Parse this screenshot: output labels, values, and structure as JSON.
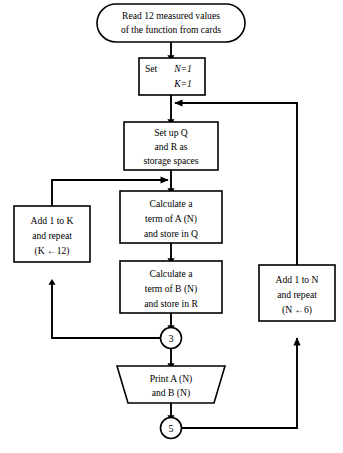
{
  "diagram": {
    "line_color": "#000000",
    "fill_color": "#ffffff"
  },
  "nodes": {
    "read_terminal": {
      "shape": "stadium",
      "lines": [
        "Read 12 measured values",
        "of the function from cards"
      ]
    },
    "set_init": {
      "shape": "rect",
      "label_prefix": "Set",
      "lines": [
        "N=1",
        "K=1"
      ]
    },
    "setup_storage": {
      "shape": "rect",
      "lines": [
        "Set up Q",
        "and R as",
        "storage spaces"
      ]
    },
    "calc_a": {
      "shape": "rect",
      "lines": [
        "Calculate a",
        "term of A (N)",
        "and store in Q"
      ]
    },
    "calc_b": {
      "shape": "rect",
      "lines": [
        "Calculate a",
        "term of B (N)",
        "and store in R"
      ]
    },
    "add_k": {
      "shape": "rect",
      "lines": [
        "Add 1 to K",
        "and repeat",
        "(K ←12)"
      ]
    },
    "add_n": {
      "shape": "rect",
      "lines": [
        "Add 1 to N",
        "and repeat",
        "(N ←6)"
      ]
    },
    "print_out": {
      "shape": "trapezoid",
      "lines": [
        "Print A (N)",
        "and B (N)"
      ]
    },
    "connector_3": {
      "shape": "circle",
      "label": "3"
    },
    "connector_5": {
      "shape": "circle",
      "label": "5"
    }
  },
  "edges": [
    {
      "name": "read-to-set",
      "from": "read_terminal",
      "to": "set_init"
    },
    {
      "name": "set-to-setup",
      "from": "set_init",
      "to": "setup_storage"
    },
    {
      "name": "setup-to-calc-a",
      "from": "setup_storage",
      "to": "calc_a"
    },
    {
      "name": "calc-a-to-calc-b",
      "from": "calc_a",
      "to": "calc_b"
    },
    {
      "name": "calc-b-to-connector-3",
      "from": "calc_b",
      "to": "connector_3"
    },
    {
      "name": "connector-3-to-add-k",
      "from": "connector_3",
      "to": "add_k"
    },
    {
      "name": "add-k-to-calc-a",
      "from": "add_k",
      "to": "calc_a"
    },
    {
      "name": "connector-3-to-print",
      "from": "connector_3",
      "to": "print_out"
    },
    {
      "name": "print-to-connector-5",
      "from": "print_out",
      "to": "connector_5"
    },
    {
      "name": "connector-5-to-add-n",
      "from": "connector_5",
      "to": "add_n"
    },
    {
      "name": "add-n-to-set-loop",
      "from": "add_n",
      "to": "set_init"
    }
  ]
}
